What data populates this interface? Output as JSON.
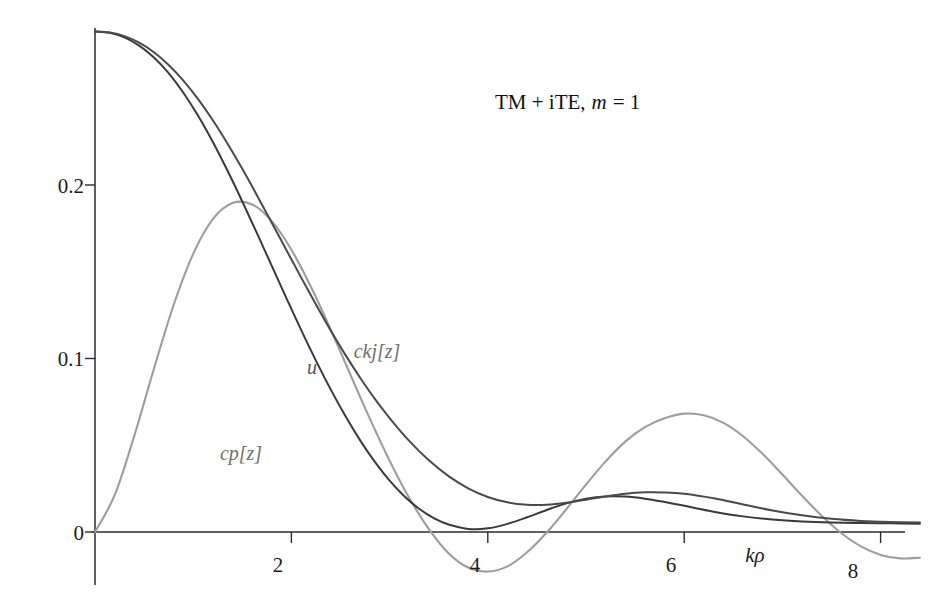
{
  "chart_data": {
    "type": "line",
    "title_parts": {
      "prefix": "TM + iTE, ",
      "symbol": "m",
      "suffix": " = 1"
    },
    "xlabel": "kρ",
    "ylabel": "",
    "xlim": [
      -0.2,
      8.6
    ],
    "ylim": [
      -0.032,
      0.2905
    ],
    "grid": false,
    "legend_position": "inline-annotations",
    "xticks": [
      2,
      4,
      6,
      8
    ],
    "xtick_labels": [
      "2",
      "4",
      "6",
      "8"
    ],
    "yticks": [
      0,
      0.1,
      0.2
    ],
    "ytick_labels": [
      "0",
      "0.1",
      "0.2"
    ],
    "annotations": [
      {
        "text": "u",
        "x": 2.25,
        "y": 0.101,
        "color": "#555555"
      },
      {
        "text": "ckj[z]",
        "x": 2.86,
        "y": 0.108,
        "color": "#8f8f8f"
      },
      {
        "text": "cp[z]",
        "x": 1.45,
        "y": 0.0465,
        "color": "#6f6f6f"
      }
    ],
    "series": [
      {
        "name": "cp[z]",
        "color": "#3a3a3a",
        "x": [
          0,
          0.15,
          0.3,
          0.45,
          0.6,
          0.75,
          0.9,
          1.05,
          1.2,
          1.35,
          1.5,
          1.65,
          1.8,
          1.95,
          2.1,
          2.25,
          2.4,
          2.55,
          2.7,
          2.85,
          3.0,
          3.15,
          3.3,
          3.45,
          3.6,
          3.8,
          4.0,
          4.2,
          4.4,
          4.6,
          4.8,
          5.0,
          5.2,
          5.4,
          5.6,
          5.8,
          6.0,
          6.3,
          6.6,
          6.9,
          7.2,
          7.5,
          7.8,
          8.1,
          8.4
        ],
        "y": [
          0.2885,
          0.2877,
          0.2851,
          0.2803,
          0.2735,
          0.2645,
          0.2532,
          0.2399,
          0.2248,
          0.2082,
          0.1905,
          0.1721,
          0.1534,
          0.1347,
          0.1164,
          0.0988,
          0.0822,
          0.0668,
          0.0528,
          0.0404,
          0.0296,
          0.0206,
          0.0134,
          0.008,
          0.0043,
          0.0018,
          0.0021,
          0.0047,
          0.0085,
          0.0127,
          0.0165,
          0.0192,
          0.0205,
          0.0204,
          0.0192,
          0.0173,
          0.0151,
          0.0117,
          0.009,
          0.0072,
          0.0061,
          0.0055,
          0.0052,
          0.005,
          0.0048
        ]
      },
      {
        "name": "u",
        "color": "#4a4a4a",
        "x": [
          0,
          0.15,
          0.3,
          0.45,
          0.6,
          0.75,
          0.9,
          1.05,
          1.2,
          1.35,
          1.5,
          1.65,
          1.8,
          1.95,
          2.1,
          2.25,
          2.4,
          2.55,
          2.7,
          2.85,
          3.0,
          3.2,
          3.4,
          3.6,
          3.8,
          4.0,
          4.2,
          4.4,
          4.6,
          4.8,
          5.0,
          5.2,
          5.4,
          5.6,
          5.8,
          6.0,
          6.3,
          6.6,
          6.9,
          7.2,
          7.5,
          7.8,
          8.1,
          8.4
        ],
        "y": [
          0.2885,
          0.2879,
          0.2858,
          0.282,
          0.2765,
          0.2692,
          0.2602,
          0.2495,
          0.2373,
          0.2238,
          0.2093,
          0.194,
          0.1783,
          0.1624,
          0.1466,
          0.1311,
          0.1162,
          0.1021,
          0.0889,
          0.0767,
          0.0657,
          0.0525,
          0.0413,
          0.0322,
          0.0252,
          0.0202,
          0.0171,
          0.0157,
          0.0157,
          0.0168,
          0.0186,
          0.0205,
          0.0221,
          0.0229,
          0.0228,
          0.022,
          0.0194,
          0.0159,
          0.0124,
          0.0096,
          0.0076,
          0.0064,
          0.0058,
          0.0055
        ]
      },
      {
        "name": "ckj[z]",
        "color": "#9d9d9d",
        "x": [
          0,
          0.2,
          0.4,
          0.6,
          0.8,
          1.0,
          1.2,
          1.4,
          1.6,
          1.8,
          2.0,
          2.2,
          2.4,
          2.6,
          2.8,
          3.0,
          3.2,
          3.4,
          3.6,
          3.8,
          4.0,
          4.2,
          4.4,
          4.6,
          4.8,
          5.0,
          5.2,
          5.4,
          5.6,
          5.8,
          6.0,
          6.2,
          6.4,
          6.6,
          6.8,
          7.0,
          7.2,
          7.4,
          7.6,
          7.8,
          8.0,
          8.2,
          8.4
        ],
        "y": [
          0.0,
          0.0212,
          0.0554,
          0.0941,
          0.1307,
          0.1603,
          0.1803,
          0.1896,
          0.1888,
          0.1792,
          0.1627,
          0.1412,
          0.1167,
          0.0908,
          0.0652,
          0.0411,
          0.0196,
          0.0017,
          -0.0122,
          -0.0205,
          -0.0228,
          -0.0198,
          -0.0117,
          -0.0003,
          0.0132,
          0.0273,
          0.0407,
          0.0521,
          0.0604,
          0.0655,
          0.0682,
          0.0673,
          0.0629,
          0.0552,
          0.0449,
          0.0331,
          0.0209,
          0.0093,
          -0.0007,
          -0.0083,
          -0.0132,
          -0.0152,
          -0.0148
        ]
      }
    ]
  },
  "axis": {
    "x_label": "kρ",
    "y_tick_0": "0",
    "y_tick_1": "0.1",
    "y_tick_2": "0.2",
    "x_tick_2": "2",
    "x_tick_4": "4",
    "x_tick_6": "6",
    "x_tick_8": "8"
  },
  "labels": {
    "curve_u": "u",
    "curve_ckj": "ckj[z]",
    "curve_cp": "cp[z]"
  },
  "title": {
    "prefix": "TM + iTE,",
    "symbol": "m",
    "suffix": "= 1"
  },
  "colors": {
    "dark_curve": "#3a3a3a",
    "mid_curve": "#4a4a4a",
    "gray_curve": "#9d9d9d",
    "axis": "#2b2b2b",
    "background": "#ffffff"
  }
}
